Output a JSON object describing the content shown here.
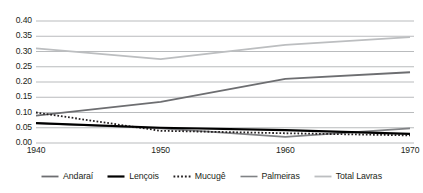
{
  "chart_data": {
    "type": "line",
    "title": "",
    "xlabel": "",
    "ylabel": "",
    "x": [
      1940,
      1950,
      1960,
      1970
    ],
    "xlim": [
      1940,
      1970
    ],
    "ylim": [
      0.0,
      0.4
    ],
    "ytick_labels": [
      "0.00",
      "0.05",
      "0.10",
      "0.15",
      "0.20",
      "0.25",
      "0.30",
      "0.35",
      "0.40"
    ],
    "ytick_values": [
      0.0,
      0.05,
      0.1,
      0.15,
      0.2,
      0.25,
      0.3,
      0.35,
      0.4
    ],
    "xtick_labels": [
      "1940",
      "1950",
      "1960",
      "1970"
    ],
    "grid": "horizontal",
    "legend_position": "bottom",
    "series": [
      {
        "name": "Andaraí",
        "color": "#6d6e71",
        "style": "solid",
        "width": 1.8,
        "values": [
          0.09,
          0.135,
          0.21,
          0.232
        ]
      },
      {
        "name": "Lençois",
        "color": "#000000",
        "style": "solid",
        "width": 2.2,
        "values": [
          0.065,
          0.05,
          0.042,
          0.03
        ]
      },
      {
        "name": "Mucugê",
        "color": "#231f20",
        "style": "dotted",
        "width": 1.8,
        "values": [
          0.1,
          0.04,
          0.032,
          0.025
        ]
      },
      {
        "name": "Palmeiras",
        "color": "#808285",
        "style": "solid",
        "width": 1.6,
        "values": [
          0.065,
          0.048,
          0.02,
          0.048
        ]
      },
      {
        "name": "Total Lavras",
        "color": "#bcbec0",
        "style": "solid",
        "width": 1.8,
        "values": [
          0.31,
          0.275,
          0.322,
          0.347
        ]
      }
    ]
  },
  "legend": {
    "items": [
      {
        "label": "Andaraí"
      },
      {
        "label": "Lençois"
      },
      {
        "label": "Mucugê"
      },
      {
        "label": "Palmeiras"
      },
      {
        "label": "Total Lavras"
      }
    ]
  },
  "axes": {
    "y_labels": [
      "0.40",
      "0.35",
      "0.30",
      "0.25",
      "0.20",
      "0.15",
      "0.10",
      "0.05",
      "0.00"
    ],
    "x_labels": [
      "1940",
      "1950",
      "1960",
      "1970"
    ]
  },
  "colors": {
    "grid": "#a7a9ac",
    "background": "#ffffff",
    "text": "#231f20"
  }
}
